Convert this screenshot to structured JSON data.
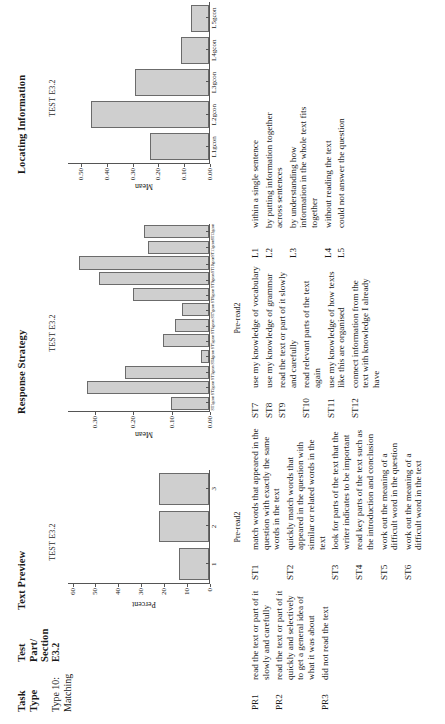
{
  "header": {
    "col_task_type": "Task\nType",
    "col_test_part": "Test\nPart/\nSection",
    "col_text_preview": "Text Preview",
    "col_response_strategy": "Response Strategy",
    "col_locating_information": "Locating Information",
    "task_type_value": "Type 10:\nMatching",
    "test_part_value": "E3.2"
  },
  "chart_data": [
    {
      "type": "bar",
      "title": "TEST E3.2",
      "panel": "Text Preview",
      "categories": [
        "1",
        "2",
        "3"
      ],
      "values": [
        13,
        22,
        22
      ],
      "xlabel": "Pre-read2",
      "ylabel": "Percent",
      "yticks": [
        0,
        10,
        20,
        30,
        40,
        50,
        60
      ],
      "ylim": [
        0,
        62
      ],
      "grid": false
    },
    {
      "type": "bar",
      "title": "TEST E3.2",
      "panel": "Response Strategy",
      "categories": [
        "ST1gcon",
        "ST2gcon",
        "ST3gcon",
        "ST4gcon",
        "ST5gcon",
        "ST6gcon",
        "ST7gcon",
        "ST8gcon",
        "ST9gcon",
        "ST10gcon",
        "ST11gcon",
        "ST12gcon"
      ],
      "values": [
        0.1,
        0.32,
        0.22,
        0.02,
        0.12,
        0.09,
        0.07,
        0.2,
        0.29,
        0.34,
        0.16,
        0.17
      ],
      "xlabel": "Pre-read2",
      "ylabel": "Mean",
      "yticks": [
        0,
        0.1,
        0.2,
        0.3
      ],
      "ylim": [
        0,
        0.37
      ],
      "grid": false
    },
    {
      "type": "bar",
      "title": "TEST E3.2",
      "panel": "Locating Information",
      "categories": [
        "L1gcon",
        "L2gcon",
        "L3gcon",
        "L4gcon",
        "L5gcon"
      ],
      "values": [
        0.23,
        0.46,
        0.29,
        0.11,
        0.07
      ],
      "xlabel": "",
      "ylabel": "Mean",
      "yticks": [
        0,
        0.1,
        0.2,
        0.3,
        0.4,
        0.5
      ],
      "ylim": [
        0,
        0.55
      ],
      "grid": false
    }
  ],
  "legend": {
    "column_a": [
      {
        "code": "PR1",
        "text": "read the text or part of it slowly and carefully"
      },
      {
        "code": "PR2",
        "text": "read the text or part of it quickly and selectively to get a general idea of what it was about"
      },
      {
        "code": "PR3",
        "text": "did not read the text"
      }
    ],
    "column_b": [
      {
        "code": "ST1",
        "text": "match words that appeared in the question with exactly the same words in the text"
      },
      {
        "code": "ST2",
        "text": "quickly match words that appeared in the question with similar or related words in the text"
      },
      {
        "code": "ST3",
        "text": "look for parts of the text that the writer indicates to be important"
      },
      {
        "code": "ST4",
        "text": "read key parts of the text such as the introduction and conclusion"
      },
      {
        "code": "ST5",
        "text": "work out the meaning of a difficult word in the question"
      },
      {
        "code": "ST6",
        "text": "work out the meaning of a difficult word in the text"
      }
    ],
    "column_c": [
      {
        "code": "ST7",
        "text": "use my knowledge of vocabulary"
      },
      {
        "code": "ST8",
        "text": "use my knowledge of grammar"
      },
      {
        "code": "ST9",
        "text": "read the text or part of it slowly and carefully"
      },
      {
        "code": "ST10",
        "text": "read relevant parts of the text again"
      },
      {
        "code": "ST11",
        "text": "use my knowledge of how texts like this are organised"
      },
      {
        "code": "ST12",
        "text": "connect information from the text with knowledge I already have"
      }
    ],
    "column_d": [
      {
        "code": "L1",
        "text": "within a single sentence"
      },
      {
        "code": "L2",
        "text": "by putting information together across sentences"
      },
      {
        "code": "L3",
        "text": "by understanding how information in the whole text fits together"
      },
      {
        "code": "L4",
        "text": "without reading the text"
      },
      {
        "code": "L5",
        "text": "could not answer the question"
      }
    ]
  }
}
